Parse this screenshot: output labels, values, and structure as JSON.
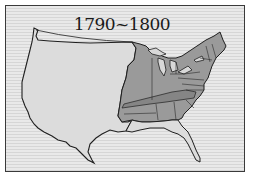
{
  "map": {
    "title": "1790~1800",
    "colors": {
      "background": "#e6e6e6",
      "territory_fill": "#dcdcdc",
      "states_fill": "#9a9a9a",
      "states_dark_fill": "#858585",
      "outline": "#1f1f1f",
      "frame": "#3a3a3a"
    },
    "regions": [
      {
        "name": "Western territory",
        "shading": "light"
      },
      {
        "name": "United States 1790-1800",
        "shading": "dark"
      }
    ]
  }
}
